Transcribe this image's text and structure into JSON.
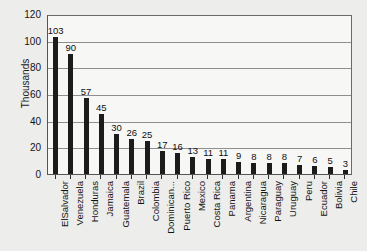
{
  "chart_data": {
    "type": "bar",
    "title": "",
    "xlabel": "",
    "ylabel": "Thousands",
    "ylim": [
      0,
      120
    ],
    "ytick_step": 20,
    "yticks": [
      0,
      20,
      40,
      60,
      80,
      100,
      120
    ],
    "ytick_labels": [
      "0",
      "20",
      "40",
      "60",
      "80",
      "100",
      "120"
    ],
    "grid": true,
    "legend": false,
    "orientation": "vertical",
    "bar_color": "#1c1c1c",
    "plot_background": "#f7f7f6",
    "page_background": "#ededec",
    "data_labels": true,
    "categories": [
      "ElSalvador",
      "Venezuela",
      "Honduras",
      "Jamaica",
      "Guatemala",
      "Brazil",
      "Colombia",
      "Dominican...",
      "Puerto Rico",
      "Mexico",
      "Costa Rica",
      "Panama",
      "Argentina",
      "Nicaragua",
      "Paraguay",
      "Uruguay",
      "Peru",
      "Ecuador",
      "Bolivia",
      "Chile"
    ],
    "values": [
      103,
      90,
      57,
      45,
      30,
      26,
      25,
      17,
      16,
      13,
      11,
      11,
      9,
      8,
      8,
      8,
      7,
      6,
      5,
      3
    ],
    "value_labels": [
      "103",
      "90",
      "57",
      "45",
      "30",
      "26",
      "25",
      "17",
      "16",
      "13",
      "11",
      "11",
      "9",
      "8",
      "8",
      "8",
      "7",
      "6",
      "5",
      "3"
    ]
  }
}
